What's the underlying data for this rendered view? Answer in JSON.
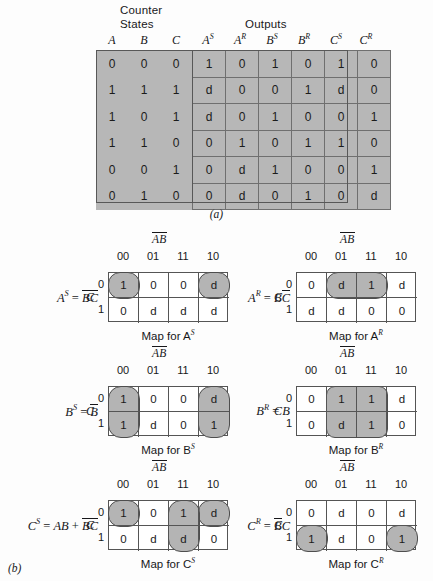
{
  "figure": {
    "caption_a": "(a)",
    "caption_b": "(b)"
  },
  "truth_table": {
    "group_headers": {
      "counter": "Counter",
      "states": "States",
      "outputs": "Outputs"
    },
    "columns": [
      "A",
      "B",
      "C",
      "A",
      "A",
      "B",
      "B",
      "C",
      "C"
    ],
    "column_supers": [
      "",
      "",
      "",
      "S",
      "R",
      "S",
      "R",
      "S",
      "R"
    ],
    "rows": [
      [
        "0",
        "0",
        "0",
        "1",
        "0",
        "1",
        "0",
        "1",
        "0"
      ],
      [
        "1",
        "1",
        "1",
        "d",
        "0",
        "0",
        "1",
        "d",
        "0"
      ],
      [
        "1",
        "0",
        "1",
        "d",
        "0",
        "1",
        "0",
        "0",
        "1"
      ],
      [
        "1",
        "1",
        "0",
        "0",
        "1",
        "0",
        "1",
        "1",
        "0"
      ],
      [
        "0",
        "0",
        "1",
        "0",
        "d",
        "1",
        "0",
        "0",
        "1"
      ],
      [
        "0",
        "1",
        "0",
        "0",
        "d",
        "0",
        "1",
        "0",
        "d"
      ]
    ]
  },
  "kmaps": [
    {
      "id": "as",
      "ab_label": "AB",
      "col_labels": [
        "00",
        "01",
        "11",
        "10"
      ],
      "row_labels": [
        "0",
        "1"
      ],
      "c_var": "C",
      "eq_lhs": "A",
      "eq_lhs_sup": "S",
      "eq_rhs": "BC",
      "caption": "Map for A",
      "caption_sup": "S",
      "cells": [
        [
          "1",
          "0",
          "0",
          "d"
        ],
        [
          "0",
          "d",
          "d",
          "d"
        ]
      ]
    },
    {
      "id": "ar",
      "ab_label": "AB",
      "col_labels": [
        "00",
        "01",
        "11",
        "10"
      ],
      "row_labels": [
        "0",
        "1"
      ],
      "c_var": "C",
      "eq_lhs": "A",
      "eq_lhs_sup": "R",
      "eq_rhs": "BC",
      "caption": "Map for A",
      "caption_sup": "R",
      "cells": [
        [
          "0",
          "d",
          "1",
          "d"
        ],
        [
          "d",
          "d",
          "0",
          "0"
        ]
      ]
    },
    {
      "id": "bs",
      "ab_label": "AB",
      "col_labels": [
        "00",
        "01",
        "11",
        "10"
      ],
      "row_labels": [
        "0",
        "1"
      ],
      "c_var": "C",
      "eq_lhs": "B",
      "eq_lhs_sup": "S",
      "eq_rhs": "B",
      "caption": "Map for B",
      "caption_sup": "S",
      "cells": [
        [
          "1",
          "0",
          "0",
          "d"
        ],
        [
          "1",
          "d",
          "0",
          "1"
        ]
      ]
    },
    {
      "id": "br",
      "ab_label": "AB",
      "col_labels": [
        "00",
        "01",
        "11",
        "10"
      ],
      "row_labels": [
        "0",
        "1"
      ],
      "c_var": "C",
      "eq_lhs": "B",
      "eq_lhs_sup": "R",
      "eq_rhs": "B",
      "caption": "Map for B",
      "caption_sup": "R",
      "cells": [
        [
          "0",
          "1",
          "1",
          "d"
        ],
        [
          "0",
          "d",
          "1",
          "0"
        ]
      ]
    },
    {
      "id": "cs",
      "ab_label": "AB",
      "col_labels": [
        "00",
        "01",
        "11",
        "10"
      ],
      "row_labels": [
        "0",
        "1"
      ],
      "c_var": "C",
      "eq_lhs": "C",
      "eq_lhs_sup": "S",
      "eq_rhs": "AB + BC",
      "caption": "Map for C",
      "caption_sup": "S",
      "cells": [
        [
          "1",
          "0",
          "1",
          "d"
        ],
        [
          "0",
          "d",
          "d",
          "0"
        ]
      ]
    },
    {
      "id": "cr",
      "ab_label": "AB",
      "col_labels": [
        "00",
        "01",
        "11",
        "10"
      ],
      "row_labels": [
        "0",
        "1"
      ],
      "c_var": "C",
      "eq_lhs": "C",
      "eq_lhs_sup": "R",
      "eq_rhs": "BC",
      "caption": "Map for C",
      "caption_sup": "R",
      "cells": [
        [
          "0",
          "d",
          "0",
          "d"
        ],
        [
          "1",
          "d",
          "0",
          "1"
        ]
      ]
    }
  ],
  "colors": {
    "shade": "#b4b4b4",
    "table_fill": "#b7b7b7",
    "grid_line": "#555555",
    "background": "#fdfdfd"
  }
}
